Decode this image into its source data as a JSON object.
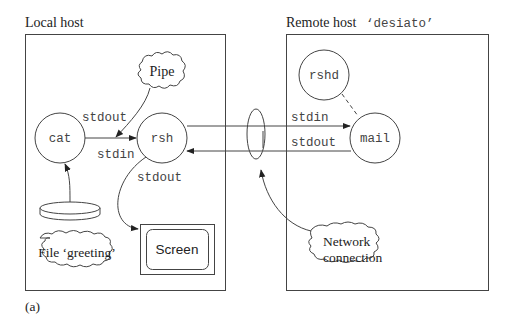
{
  "diagram": {
    "caption": "(a)",
    "local_host": {
      "title": "Local host",
      "nodes": {
        "cat": "cat",
        "rsh": "rsh",
        "pipe": "Pipe",
        "file": "File ‘greeting’",
        "screen": "Screen"
      },
      "labels": {
        "cat_stdout": "stdout",
        "rsh_stdin": "stdin",
        "rsh_stdout": "stdout"
      }
    },
    "remote_host": {
      "title": "Remote host",
      "hostname": "‘desiato’",
      "nodes": {
        "rshd": "rshd",
        "mail": "mail"
      },
      "labels": {
        "mail_stdin": "stdin",
        "mail_stdout": "stdout"
      }
    },
    "network": {
      "line1": "Network",
      "line2": "connection"
    },
    "edges": [
      {
        "from": "cat",
        "to": "rsh",
        "label": "stdout / stdin"
      },
      {
        "from": "pipe",
        "to": "cat-rsh-edge"
      },
      {
        "from": "file",
        "to": "cat"
      },
      {
        "from": "rsh",
        "to": "screen",
        "label": "stdout"
      },
      {
        "from": "rsh",
        "to": "mail",
        "label": "stdin"
      },
      {
        "from": "mail",
        "to": "rsh",
        "label": "stdout"
      },
      {
        "from": "rshd",
        "to": "mail",
        "style": "dashed"
      },
      {
        "from": "network-connection",
        "to": "connection-ellipse"
      }
    ]
  }
}
